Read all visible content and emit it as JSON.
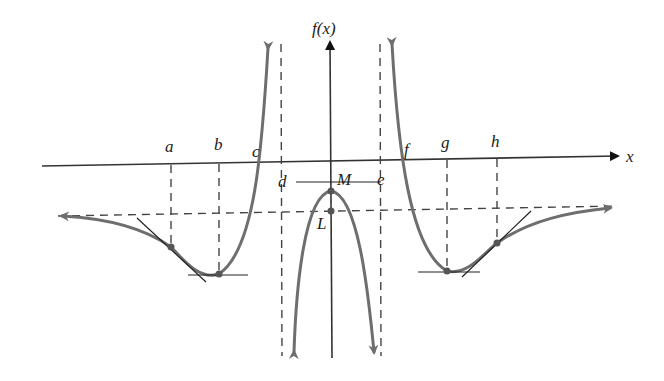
{
  "diagram": {
    "y_axis_label": "f(x)",
    "x_axis_label": "x",
    "x_points": {
      "a": "a",
      "b": "b",
      "c": "c",
      "d": "d",
      "e": "e",
      "f": "f",
      "g": "g",
      "h": "h"
    },
    "y_points": {
      "M": "M",
      "L": "L"
    },
    "colors": {
      "curve": "#6e6e6e",
      "axes": "#333333",
      "dashed": "#444444",
      "tangent": "#222222"
    }
  }
}
